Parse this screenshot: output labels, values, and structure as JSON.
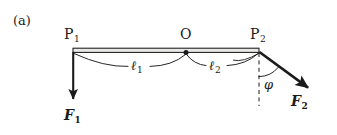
{
  "figure": {
    "panel_tag": "(a)",
    "background_color": "#ffffff",
    "ink_color": "#1a1a1a",
    "bar_fill_color": "#e8e8e6",
    "points": [
      {
        "name": "P1",
        "label": "P",
        "subscript": "1",
        "x": 73,
        "y": 50
      },
      {
        "name": "O",
        "label": "O",
        "subscript": "",
        "x": 186,
        "y": 50
      },
      {
        "name": "P2",
        "label": "P",
        "subscript": "2",
        "x": 259,
        "y": 50
      }
    ],
    "segments": [
      {
        "name": "l1",
        "label": "ℓ",
        "subscript": "1",
        "from": "P1",
        "to": "O"
      },
      {
        "name": "l2",
        "label": "ℓ",
        "subscript": "2",
        "from": "O",
        "to": "P2"
      }
    ],
    "forces": [
      {
        "name": "F1",
        "label": "F",
        "subscript": "1",
        "origin_x": 73,
        "origin_y": 52,
        "tip_x": 73,
        "tip_y": 101,
        "direction": "down"
      },
      {
        "name": "F2",
        "label": "F",
        "subscript": "2",
        "origin_x": 259,
        "origin_y": 52,
        "tip_x": 311,
        "tip_y": 90,
        "direction": "down-right"
      }
    ],
    "angle": {
      "name": "phi",
      "label": "φ",
      "vertex_x": 259,
      "vertex_y": 52,
      "reference": "dashed-vertical"
    },
    "labels": {
      "panel_tag_text": "(a)",
      "p1_text": "P",
      "p1_sub": "1",
      "o_text": "O",
      "p2_text": "P",
      "p2_sub": "2",
      "l1_text": "ℓ",
      "l1_sub": "1",
      "l2_text": "ℓ",
      "l2_sub": "2",
      "f1_text": "F",
      "f1_sub": "1",
      "f2_text": "F",
      "f2_sub": "2",
      "phi_text": "φ"
    }
  }
}
